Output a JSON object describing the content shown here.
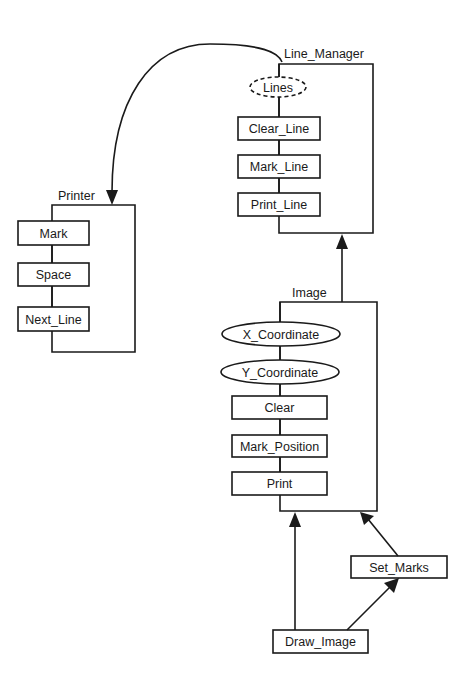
{
  "diagram": {
    "colors": {
      "ink": "#1a1a1a",
      "background": "#ffffff"
    },
    "packages": {
      "line_manager": {
        "title": "Line_Manager",
        "state": "Lines",
        "operations": [
          "Clear_Line",
          "Mark_Line",
          "Print_Line"
        ]
      },
      "printer": {
        "title": "Printer",
        "operations": [
          "Mark",
          "Space",
          "Next_Line"
        ]
      },
      "image": {
        "title": "Image",
        "objects": [
          "X_Coordinate",
          "Y_Coordinate"
        ],
        "operations": [
          "Clear",
          "Mark_Position",
          "Print"
        ]
      }
    },
    "subprograms": {
      "set_marks": "Set_Marks",
      "draw_image": "Draw_Image"
    },
    "dependencies": [
      {
        "from": "Line_Manager",
        "to": "Printer"
      },
      {
        "from": "Image",
        "to": "Line_Manager"
      },
      {
        "from": "Set_Marks",
        "to": "Image"
      },
      {
        "from": "Draw_Image",
        "to": "Image"
      },
      {
        "from": "Draw_Image",
        "to": "Set_Marks"
      }
    ]
  }
}
